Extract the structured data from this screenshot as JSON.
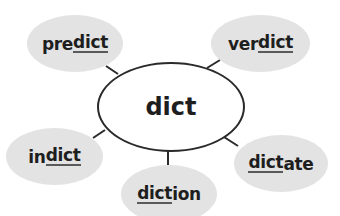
{
  "diagram": {
    "type": "word-web",
    "center": {
      "label": "dict"
    },
    "nodes": [
      {
        "id": "predict",
        "prefix": "pre",
        "root": "dict",
        "suffix": ""
      },
      {
        "id": "verdict",
        "prefix": "ver",
        "root": "dict",
        "suffix": ""
      },
      {
        "id": "indict",
        "prefix": "in",
        "root": "dict",
        "suffix": ""
      },
      {
        "id": "diction",
        "prefix": "",
        "root": "dict",
        "suffix": "ion"
      },
      {
        "id": "dictate",
        "prefix": "",
        "root": "dict",
        "suffix": "ate"
      }
    ],
    "colors": {
      "node_fill": "#e3e3e3",
      "line": "#2a2a2a",
      "text": "#1e1e1e"
    }
  }
}
